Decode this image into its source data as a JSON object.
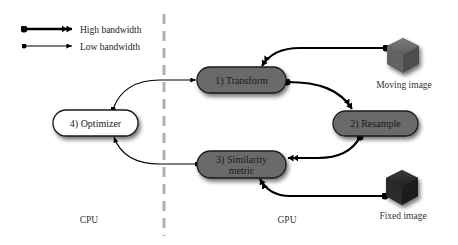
{
  "legend": {
    "high": {
      "label": "High bandwidth"
    },
    "low": {
      "label": "Low bandwidth"
    }
  },
  "regions": {
    "cpu": "CPU",
    "gpu": "GPU"
  },
  "nodes": {
    "transform": "1) Transform",
    "resample": "2) Resample",
    "similarity_line1": "3) Similarity",
    "similarity_line2": "metric",
    "optimizer": "4) Optimizer"
  },
  "images": {
    "moving": "Moving image",
    "fixed": "Fixed image"
  },
  "colors": {
    "gpu_node_fill": "#6b6b6b",
    "cpu_node_fill": "#ffffff",
    "node_stroke": "#1a1a1a",
    "divider": "#b0b0b0",
    "moving_cube": "#5a5a5a",
    "fixed_cube": "#262626"
  }
}
